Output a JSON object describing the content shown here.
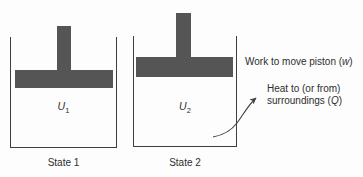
{
  "diagram": {
    "title_semantic": "piston-cylinder internal energy states",
    "states": [
      {
        "energy_symbol": "U",
        "energy_sub": "1",
        "caption": "State 1"
      },
      {
        "energy_symbol": "U",
        "energy_sub": "2",
        "caption": "State 2"
      }
    ],
    "annotations": {
      "work": {
        "prefix": "Work to move piston (",
        "symbol": "w",
        "suffix": ")"
      },
      "heat": {
        "line1": "Heat to (or from)",
        "line2_prefix": "surroundings (",
        "symbol": "Q",
        "suffix": ")"
      }
    },
    "colors": {
      "piston": "#555555",
      "line": "#3f3f3f",
      "text": "#2d2d2d",
      "background": "#fdfdfd"
    }
  }
}
